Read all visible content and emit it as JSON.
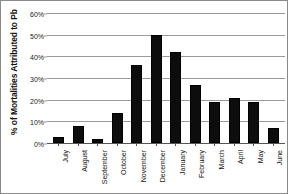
{
  "chart_data": {
    "type": "bar",
    "title": "",
    "xlabel": "",
    "ylabel": "% of Mortalities Attributed to Pb",
    "categories": [
      "July",
      "August",
      "September",
      "October",
      "November",
      "December",
      "January",
      "February",
      "March",
      "April",
      "May",
      "June"
    ],
    "values": [
      3,
      8,
      2,
      14,
      36,
      50,
      42,
      27,
      19,
      21,
      19,
      7
    ],
    "ylim": [
      0,
      60
    ],
    "ytick_labels": [
      "0%",
      "10%",
      "20%",
      "30%",
      "40%",
      "50%",
      "60%"
    ],
    "ytick_values": [
      0,
      10,
      20,
      30,
      40,
      50,
      60
    ],
    "grid": true,
    "legend": "none",
    "bar_color": "#0d0d0d",
    "grid_color": "#9a9a9a",
    "background": "#ffffff"
  }
}
